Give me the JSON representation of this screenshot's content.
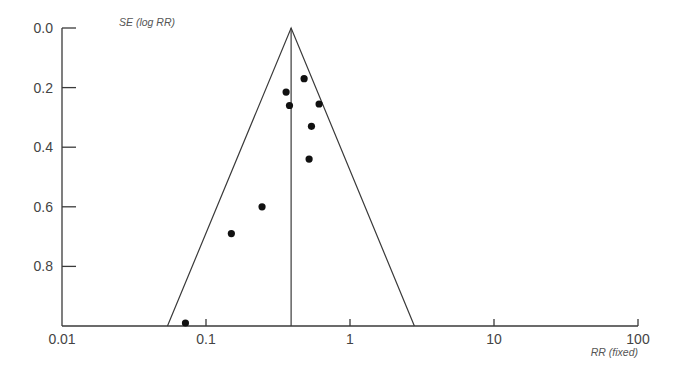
{
  "chart_data": {
    "type": "scatter",
    "subtype": "funnel-plot",
    "title": "",
    "xlabel": "RR (fixed)",
    "ylabel": "SE (log RR)",
    "x_scale": "log",
    "xlim": [
      0.01,
      100
    ],
    "ylim": [
      0.0,
      1.0
    ],
    "y_inverted": true,
    "x_ticks": [
      0.01,
      0.1,
      1,
      10,
      100
    ],
    "x_tick_labels": [
      "0.01",
      "0.1",
      "1",
      "10",
      "100"
    ],
    "y_ticks": [
      0.0,
      0.2,
      0.4,
      0.6,
      0.8
    ],
    "y_tick_labels": [
      "0.0",
      "0.2",
      "0.4",
      "0.6",
      "0.8"
    ],
    "grid": false,
    "legend": null,
    "pooled_estimate_rr": 0.39,
    "funnel": {
      "apex": {
        "rr": 0.39,
        "se": 0.0
      },
      "left_base": {
        "rr": 0.054,
        "se": 1.0
      },
      "right_base": {
        "rr": 2.8,
        "se": 1.0
      }
    },
    "points": [
      {
        "rr": 0.48,
        "se": 0.17
      },
      {
        "rr": 0.36,
        "se": 0.215
      },
      {
        "rr": 0.38,
        "se": 0.26
      },
      {
        "rr": 0.61,
        "se": 0.255
      },
      {
        "rr": 0.54,
        "se": 0.33
      },
      {
        "rr": 0.52,
        "se": 0.44
      },
      {
        "rr": 0.245,
        "se": 0.6
      },
      {
        "rr": 0.15,
        "se": 0.69
      },
      {
        "rr": 0.072,
        "se": 0.99
      }
    ]
  },
  "plot": {
    "x_axis_title": "RR (fixed)",
    "y_axis_title": "SE (log RR)"
  }
}
